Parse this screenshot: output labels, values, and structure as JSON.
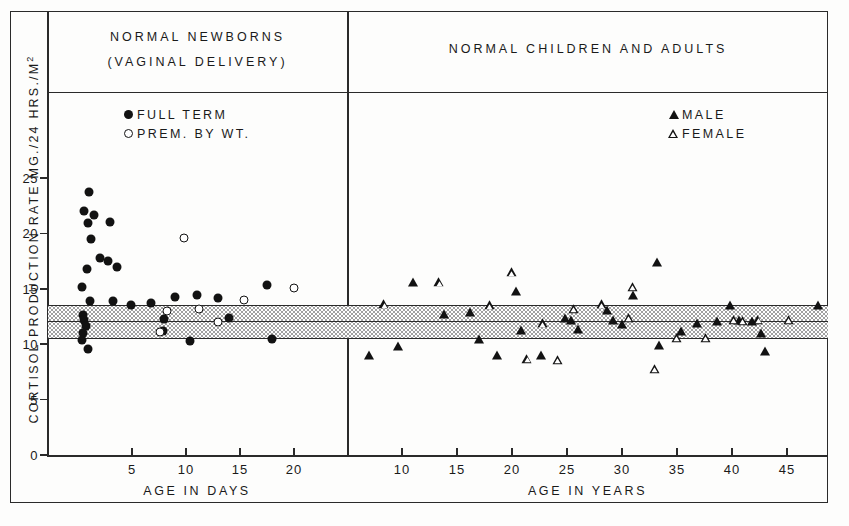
{
  "figure": {
    "y_axis_title_main": "CORTISOL  PRODUCTION  RATE  MG./24 HRS./M",
    "y_axis_title_sup": "2"
  },
  "panels": {
    "left": {
      "title_line1": "NORMAL   NEWBORNS",
      "title_line2": "(VAGINAL   DELIVERY)",
      "x_axis_title": "AGE  IN  DAYS",
      "legend": [
        {
          "marker": "filled-circle-icon",
          "label": "FULL  TERM"
        },
        {
          "marker": "open-circle-icon",
          "label": "PREM. BY  WT."
        }
      ],
      "x_ticks": [
        5,
        10,
        15,
        20
      ],
      "xlim": [
        0,
        22.5
      ]
    },
    "right": {
      "title": "NORMAL   CHILDREN  AND  ADULTS",
      "x_axis_title": "AGE  IN  YEARS",
      "legend": [
        {
          "marker": "filled-triangle-icon",
          "label": "MALE"
        },
        {
          "marker": "open-triangle-icon",
          "label": "FEMALE"
        }
      ],
      "x_ticks": [
        10,
        15,
        20,
        25,
        30,
        35,
        40,
        45
      ],
      "xlim": [
        5.5,
        49.5
      ]
    }
  },
  "chart_data": {
    "type": "scatter",
    "ylabel": "CORTISOL PRODUCTION RATE MG./24 HRS./M2",
    "ylim": [
      0,
      27
    ],
    "y_ticks": [
      0,
      5,
      10,
      15,
      20,
      25
    ],
    "grid": false,
    "legend_position": "inside-top",
    "reference_band": {
      "label": "normal adult range (shaded)",
      "upper": 13.5,
      "mean": 12.2,
      "lower": 10.5,
      "fill": "#e8e8e8",
      "line_color": "#2a2a2a"
    },
    "panels": [
      {
        "name": "NORMAL NEWBORNS (VAGINAL DELIVERY)",
        "xlabel": "AGE IN DAYS",
        "xlim": [
          0,
          22.5
        ],
        "x_ticks": [
          5,
          10,
          15,
          20
        ],
        "series": [
          {
            "name": "FULL TERM",
            "marker": "filled-circle",
            "color": "#121212",
            "points": [
              [
                1.0,
                23.7
              ],
              [
                0.6,
                22.0
              ],
              [
                1.5,
                21.7
              ],
              [
                0.9,
                20.9
              ],
              [
                3.0,
                21.0
              ],
              [
                1.2,
                19.5
              ],
              [
                2.0,
                17.8
              ],
              [
                2.8,
                17.5
              ],
              [
                3.6,
                17.0
              ],
              [
                0.8,
                16.8
              ],
              [
                0.4,
                15.2
              ],
              [
                1.1,
                13.9
              ],
              [
                3.2,
                13.9
              ],
              [
                4.9,
                13.5
              ],
              [
                6.8,
                13.7
              ],
              [
                8.0,
                12.3
              ],
              [
                7.9,
                11.2
              ],
              [
                9.0,
                14.3
              ],
              [
                11.0,
                14.4
              ],
              [
                10.4,
                10.3
              ],
              [
                13.0,
                14.2
              ],
              [
                14.0,
                12.4
              ],
              [
                17.5,
                15.3
              ],
              [
                18.0,
                10.5
              ],
              [
                0.5,
                12.6
              ],
              [
                0.6,
                12.2
              ],
              [
                0.7,
                11.6
              ],
              [
                0.5,
                11.0
              ],
              [
                0.4,
                10.4
              ],
              [
                0.9,
                9.6
              ]
            ]
          },
          {
            "name": "PREM. BY WT.",
            "marker": "open-circle",
            "color": "#121212",
            "points": [
              [
                9.8,
                19.6
              ],
              [
                8.2,
                13.0
              ],
              [
                7.6,
                11.1
              ],
              [
                11.2,
                13.2
              ],
              [
                13.0,
                12.0
              ],
              [
                15.4,
                14.0
              ],
              [
                20.0,
                15.1
              ]
            ]
          }
        ]
      },
      {
        "name": "NORMAL CHILDREN AND ADULTS",
        "xlabel": "AGE IN YEARS",
        "xlim": [
          5.5,
          49.5
        ],
        "x_ticks": [
          10,
          15,
          20,
          25,
          30,
          35,
          40,
          45
        ],
        "series": [
          {
            "name": "MALE",
            "marker": "filled-triangle",
            "color": "#121212",
            "points": [
              [
                7.0,
                9.0
              ],
              [
                9.6,
                9.8
              ],
              [
                11.0,
                15.6
              ],
              [
                13.8,
                12.7
              ],
              [
                16.2,
                12.9
              ],
              [
                17.0,
                10.5
              ],
              [
                18.6,
                9.0
              ],
              [
                20.4,
                14.8
              ],
              [
                20.8,
                11.3
              ],
              [
                22.6,
                9.0
              ],
              [
                24.8,
                12.4
              ],
              [
                26.0,
                11.4
              ],
              [
                28.6,
                13.1
              ],
              [
                29.2,
                12.2
              ],
              [
                31.0,
                14.4
              ],
              [
                33.2,
                17.4
              ],
              [
                33.4,
                9.9
              ],
              [
                35.4,
                11.2
              ],
              [
                36.8,
                11.9
              ],
              [
                38.6,
                12.1
              ],
              [
                39.8,
                13.5
              ],
              [
                40.6,
                12.2
              ],
              [
                41.8,
                12.1
              ],
              [
                42.6,
                11.0
              ],
              [
                43.0,
                9.4
              ],
              [
                47.8,
                13.5
              ],
              [
                25.4,
                12.2
              ],
              [
                30.0,
                11.8
              ]
            ]
          },
          {
            "name": "FEMALE",
            "marker": "open-triangle",
            "color": "#121212",
            "points": [
              [
                8.4,
                13.6
              ],
              [
                13.4,
                15.6
              ],
              [
                18.0,
                13.5
              ],
              [
                20.0,
                16.5
              ],
              [
                21.4,
                8.7
              ],
              [
                22.8,
                11.9
              ],
              [
                24.2,
                8.6
              ],
              [
                25.6,
                13.2
              ],
              [
                28.2,
                13.6
              ],
              [
                30.6,
                12.4
              ],
              [
                31.0,
                15.2
              ],
              [
                33.0,
                7.8
              ],
              [
                35.0,
                10.6
              ],
              [
                37.6,
                10.6
              ],
              [
                40.2,
                12.2
              ],
              [
                41.0,
                12.1
              ],
              [
                42.4,
                12.2
              ],
              [
                45.2,
                12.2
              ]
            ]
          }
        ]
      }
    ]
  }
}
